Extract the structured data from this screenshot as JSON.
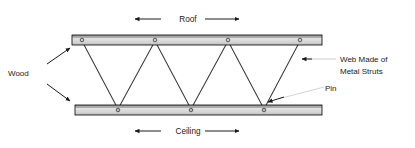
{
  "diagram": {
    "type": "engineering-cross-section",
    "labels": {
      "roof": "Roof",
      "ceiling": "Ceiling",
      "wood": "Wood",
      "web_line1": "Web Made of",
      "web_line2": "Metal Struts",
      "pin": "Pin"
    },
    "colors": {
      "background": "#ffffff",
      "outline": "#000000",
      "chord_fill_top": "#9a9a9a",
      "chord_fill_mid": "#d8d8d8",
      "chord_fill_bottom": "#c2c2c2",
      "strut": "#3a3a3a",
      "text": "#1a1a1a",
      "leader": "#b4b4b4",
      "arrow": "#1a1a1a"
    },
    "geometry": {
      "top_chord": {
        "x": 72,
        "y": 35,
        "width": 250,
        "height": 10
      },
      "bottom_chord": {
        "x": 75,
        "y": 105,
        "width": 247,
        "height": 10
      },
      "top_pins_x": [
        82,
        155,
        228,
        300
      ],
      "bottom_pins_x": [
        118,
        191,
        264
      ],
      "pin_radius": 1.8,
      "strut_count": 7
    },
    "arrows": {
      "roof_left": {
        "label": "left-arrow",
        "x1": 160,
        "y1": 19,
        "x2": 134,
        "y2": 19
      },
      "roof_right": {
        "label": "right-arrow",
        "x1": 204,
        "y1": 19,
        "x2": 238,
        "y2": 19
      },
      "ceiling_left": {
        "label": "left-arrow",
        "x1": 160,
        "y1": 131,
        "x2": 134,
        "y2": 131
      },
      "ceiling_right": {
        "label": "right-arrow",
        "x1": 204,
        "y1": 131,
        "x2": 238,
        "y2": 131
      },
      "wood_up": {
        "label": "up-right-arrow",
        "x1": 48,
        "y1": 62,
        "x2": 70,
        "y2": 47
      },
      "wood_down": {
        "label": "down-right-arrow",
        "x1": 48,
        "y1": 86,
        "x2": 70,
        "y2": 101
      },
      "web_leader": {
        "label": "left-arrow",
        "x1": 332,
        "y1": 59,
        "x2": 302,
        "y2": 59
      },
      "pin_leader": {
        "label": "down-left-arrow",
        "x1": 322,
        "y1": 86,
        "x2": 270,
        "y2": 101
      }
    }
  }
}
